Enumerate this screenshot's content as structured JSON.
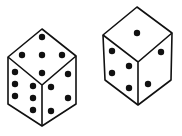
{
  "figure": {
    "colors": {
      "outline": "#111111",
      "pip": "#111111",
      "face": "#ffffff"
    }
  },
  "dice": [
    {
      "name": "die-left",
      "faces": {
        "top": 5,
        "left": 6,
        "right": 4
      },
      "pips": {
        "top": [
          [
            42,
            37
          ],
          [
            22,
            55
          ],
          [
            42,
            55
          ],
          [
            62,
            55
          ],
          [
            42,
            73
          ]
        ],
        "left": [
          [
            15,
            72
          ],
          [
            15,
            84
          ],
          [
            15,
            96
          ],
          [
            33,
            86
          ],
          [
            33,
            98
          ],
          [
            33,
            110
          ]
        ],
        "right": [
          [
            68,
            74
          ],
          [
            51,
            87
          ],
          [
            68,
            98
          ],
          [
            51,
            111
          ]
        ]
      }
    },
    {
      "name": "die-right",
      "faces": {
        "top": 1,
        "left": 4,
        "right": 2
      },
      "pips": {
        "top": [
          [
            137,
            33
          ]
        ],
        "left": [
          [
            112,
            51
          ],
          [
            129,
            66
          ],
          [
            112,
            73
          ],
          [
            129,
            88
          ]
        ],
        "right": [
          [
            161,
            52
          ],
          [
            148,
            84
          ]
        ]
      }
    }
  ]
}
